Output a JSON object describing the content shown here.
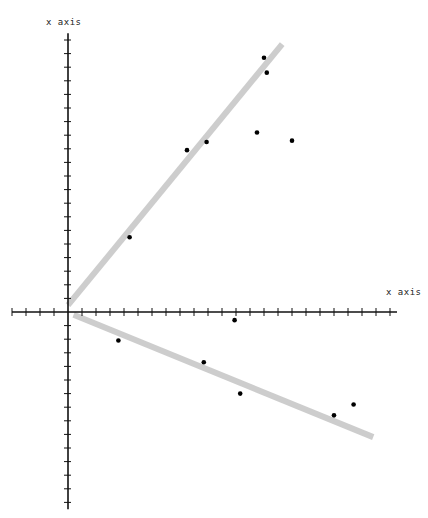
{
  "chart_data": {
    "type": "scatter",
    "title": "",
    "xlabel": "x axis",
    "ylabel": "x axis",
    "grid": false,
    "legend": null,
    "origin_px": [
      68,
      312
    ],
    "x_tick_spacing_px": 14,
    "y_tick_spacing_px": 13.6,
    "xlim": [
      -4,
      23.5
    ],
    "ylim": [
      -14.5,
      20.5
    ],
    "points": [
      {
        "x": 4.4,
        "y": 5.5
      },
      {
        "x": 8.5,
        "y": 11.9
      },
      {
        "x": 9.9,
        "y": 12.5
      },
      {
        "x": 13.5,
        "y": 13.2
      },
      {
        "x": 14.0,
        "y": 18.7
      },
      {
        "x": 14.2,
        "y": 17.6
      },
      {
        "x": 16.0,
        "y": 12.6
      },
      {
        "x": 3.6,
        "y": -2.1
      },
      {
        "x": 9.7,
        "y": -3.7
      },
      {
        "x": 11.9,
        "y": -0.6
      },
      {
        "x": 12.3,
        "y": -6.0
      },
      {
        "x": 19.0,
        "y": -7.6
      },
      {
        "x": 20.4,
        "y": -6.8
      }
    ],
    "lines": [
      {
        "name": "upper-fit",
        "x": [
          0,
          15.3
        ],
        "y": [
          0.5,
          19.7
        ],
        "color": "#c8c8c8"
      },
      {
        "name": "lower-fit",
        "x": [
          0.4,
          21.8
        ],
        "y": [
          -0.2,
          -9.2
        ],
        "color": "#c8c8c8"
      }
    ]
  },
  "labels": {
    "y_axis_title": "x axis",
    "x_axis_title": "x axis"
  },
  "colors": {
    "axis": "#111111",
    "point": "#000000",
    "fit_line": "#c8c8c8"
  }
}
